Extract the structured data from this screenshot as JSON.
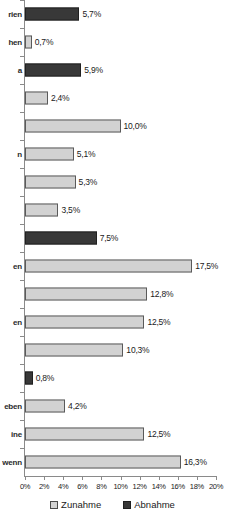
{
  "chart_data": {
    "type": "bar",
    "orientation": "horizontal",
    "title": "",
    "xlabel": "",
    "ylabel": "",
    "xlim": [
      0,
      20
    ],
    "xticks": [
      "0%",
      "2%",
      "4%",
      "6%",
      "8%",
      "10%",
      "12%",
      "14%",
      "16%",
      "18%",
      "20%"
    ],
    "xtick_values": [
      0,
      2,
      4,
      6,
      8,
      10,
      12,
      14,
      16,
      18,
      20
    ],
    "grid": false,
    "legend_position": "bottom-center",
    "legend": [
      "Zunahme",
      "Abnahme"
    ],
    "series_colors": {
      "Zunahme": "#d2d2d2",
      "Abnahme": "#383838"
    },
    "categories": [
      "rien",
      "hen",
      "a",
      "",
      "",
      "n",
      "",
      "",
      "en",
      "",
      "en",
      "",
      "",
      "eben",
      "ine",
      "wenn"
    ],
    "bars": [
      {
        "label": "rien",
        "value": 5.7,
        "value_text": "5,7%",
        "series": "Abnahme"
      },
      {
        "label": "hen",
        "value": 0.7,
        "value_text": "0,7%",
        "series": "Zunahme"
      },
      {
        "label": "a",
        "value": 5.9,
        "value_text": "5,9%",
        "series": "Abnahme"
      },
      {
        "label": "",
        "value": 2.4,
        "value_text": "2,4%",
        "series": "Zunahme"
      },
      {
        "label": "",
        "value": 10.0,
        "value_text": "10,0%",
        "series": "Zunahme"
      },
      {
        "label": "n",
        "value": 5.1,
        "value_text": "5,1%",
        "series": "Zunahme"
      },
      {
        "label": "",
        "value": 5.3,
        "value_text": "5,3%",
        "series": "Zunahme"
      },
      {
        "label": "",
        "value": 3.5,
        "value_text": "3,5%",
        "series": "Zunahme"
      },
      {
        "label": "",
        "value": 7.5,
        "value_text": "7,5%",
        "series": "Abnahme"
      },
      {
        "label": "en",
        "value": 17.5,
        "value_text": "17,5%",
        "series": "Zunahme"
      },
      {
        "label": "",
        "value": 12.8,
        "value_text": "12,8%",
        "series": "Zunahme"
      },
      {
        "label": "en",
        "value": 12.5,
        "value_text": "12,5%",
        "series": "Zunahme"
      },
      {
        "label": "",
        "value": 10.3,
        "value_text": "10,3%",
        "series": "Zunahme"
      },
      {
        "label": "",
        "value": 0.8,
        "value_text": "0,8%",
        "series": "Abnahme"
      },
      {
        "label": "eben",
        "value": 4.2,
        "value_text": "4,2%",
        "series": "Zunahme"
      },
      {
        "label": "ine",
        "value": 12.5,
        "value_text": "12,5%",
        "series": "Zunahme"
      },
      {
        "label": "wenn",
        "value": 16.3,
        "value_text": "16,3%",
        "series": "Zunahme"
      }
    ]
  }
}
